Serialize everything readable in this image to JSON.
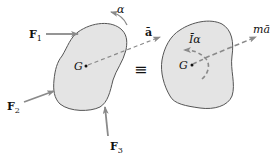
{
  "diagram": {
    "colors": {
      "body_fill": "#e4e4e4",
      "body_outline": "#555555",
      "arrow": "#8a8a8a",
      "text": "#111111"
    },
    "left_body": {
      "center_label": "G",
      "forces": [
        {
          "label": "F",
          "subscript": "1"
        },
        {
          "label": "F",
          "subscript": "2"
        },
        {
          "label": "F",
          "subscript": "3"
        }
      ],
      "angular_acceleration_label": "α",
      "acceleration_label": "ā"
    },
    "equivalence_symbol": "≡",
    "right_body": {
      "center_label": "G",
      "moment_label": "Īα",
      "inertia_force_label": "mā"
    }
  }
}
